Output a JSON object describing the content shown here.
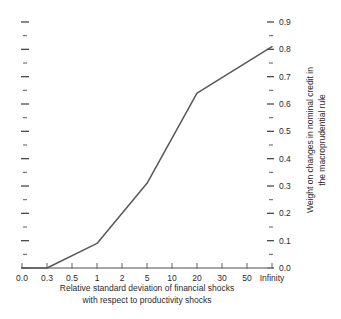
{
  "chart_data": {
    "type": "line",
    "title": "",
    "xlabel": "Relative standard deviation of financial shocks with respect to productivity shocks",
    "xlabel_line1": "Relative standard deviation of financial shocks",
    "xlabel_line2": "with respect to productivity shocks",
    "ylabel": "Weight on changes in nominal credit in the macroprudential rule",
    "ylabel_line1": "Weight on changes in nominal credit in",
    "ylabel_line2": "the macroprudential rule",
    "categories": [
      "0.0",
      "0.3",
      "0.5",
      "1",
      "2",
      "5",
      "10",
      "20",
      "30",
      "50",
      "Infinity"
    ],
    "values": [
      0.0,
      0.0,
      0.035,
      0.09,
      0.175,
      0.31,
      0.46,
      0.64,
      0.695,
      0.76,
      0.81
    ],
    "x_axis_scale": "categorical",
    "ylim": [
      0.0,
      0.9
    ],
    "ytick_labels": [
      "0.0",
      "0.1",
      "0.2",
      "0.3",
      "0.4",
      "0.5",
      "0.6",
      "0.7",
      "0.8",
      "0.9"
    ],
    "ytick_values": [
      0.0,
      0.1,
      0.2,
      0.3,
      0.4,
      0.5,
      0.6,
      0.7,
      0.8,
      0.9
    ],
    "yminor_step": 0.05,
    "ytick_side": "right",
    "grid": false,
    "legend": "none",
    "line_color": "#55585c",
    "axis_color": "#8a8a8a",
    "background": "#ffffff",
    "vertices": [
      {
        "x": "0.0",
        "y": 0.0
      },
      {
        "x": "0.3",
        "y": 0.0
      },
      {
        "x": "1",
        "y": 0.09
      },
      {
        "x": "5",
        "y": 0.31
      },
      {
        "x": "20",
        "y": 0.64
      },
      {
        "x": "Infinity",
        "y": 0.81
      }
    ]
  }
}
